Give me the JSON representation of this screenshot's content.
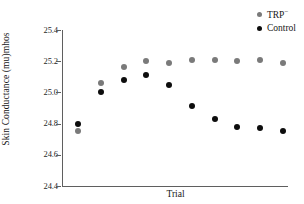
{
  "chart_data": {
    "type": "scatter",
    "title": "",
    "xlabel": "Trial",
    "ylabel": "Skin Conductance (mu)mhos",
    "ylim": [
      24.4,
      25.4
    ],
    "yticks": [
      "25.4",
      "25.2",
      "25.0",
      "24.8",
      "24.6",
      "24.4"
    ],
    "ytick_values": [
      25.4,
      25.2,
      25.0,
      24.8,
      24.6,
      24.4
    ],
    "xticks": [],
    "grid": false,
    "legend_position": "top-right",
    "x": [
      1,
      2,
      3,
      4,
      5,
      6,
      7,
      8,
      9,
      10
    ],
    "series": [
      {
        "name": "TRP",
        "name_suffix": "−",
        "color": "#7a7a7a",
        "values": [
          24.75,
          25.06,
          25.16,
          25.2,
          25.19,
          25.21,
          25.21,
          25.2,
          25.21,
          25.19
        ]
      },
      {
        "name": "Control",
        "name_suffix": "",
        "color": "#0d0d0d",
        "values": [
          24.8,
          25.0,
          25.08,
          25.11,
          25.05,
          24.91,
          24.83,
          24.78,
          24.77,
          24.75
        ]
      }
    ],
    "legend": [
      {
        "label": "TRP",
        "suffix": "−",
        "color": "#7a7a7a"
      },
      {
        "label": "Control",
        "suffix": "",
        "color": "#0d0d0d"
      }
    ]
  }
}
